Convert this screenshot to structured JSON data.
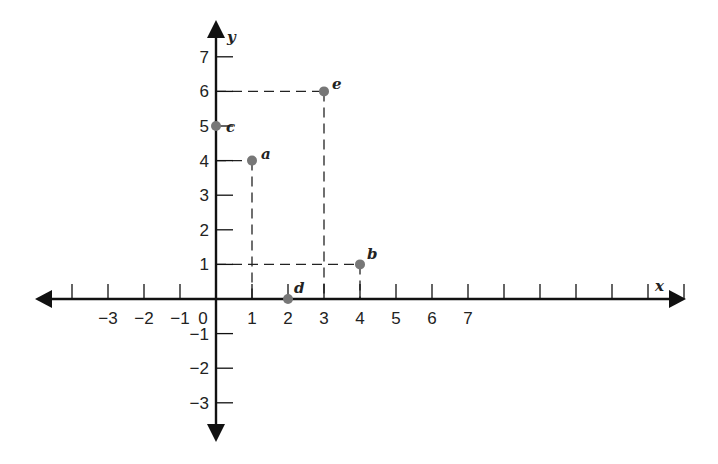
{
  "chart_data": {
    "type": "scatter",
    "title": "",
    "xlabel": "x",
    "ylabel": "y",
    "xlim": [
      -4.8,
      13
    ],
    "ylim": [
      -4.0,
      8.0
    ],
    "grid": false,
    "legend": null,
    "x_tick_positions": [
      -4,
      -3,
      -2,
      -1,
      0,
      1,
      2,
      3,
      4,
      5,
      6,
      7,
      8,
      9,
      10,
      11,
      12,
      13
    ],
    "x_tick_labels": [
      "",
      "−3",
      "−2",
      "−1",
      "0",
      "1",
      "2",
      "3",
      "4",
      "5",
      "6",
      "7",
      "",
      "",
      "",
      "",
      "",
      ""
    ],
    "y_tick_positions": [
      -3,
      -2,
      -1,
      1,
      2,
      3,
      4,
      5,
      6,
      7
    ],
    "y_tick_labels": [
      "−3",
      "−2",
      "−1",
      "1",
      "2",
      "3",
      "4",
      "5",
      "6",
      "7"
    ],
    "points": [
      {
        "label": "a",
        "x": 1,
        "y": 4
      },
      {
        "label": "b",
        "x": 4,
        "y": 1
      },
      {
        "label": "c",
        "x": 0,
        "y": 5
      },
      {
        "label": "d",
        "x": 2,
        "y": 0
      },
      {
        "label": "e",
        "x": 3,
        "y": 6
      }
    ],
    "projection_lines": "dashed lines from points a, b, e to both axes",
    "point_color": "#777777",
    "axis_color": "#111111"
  }
}
